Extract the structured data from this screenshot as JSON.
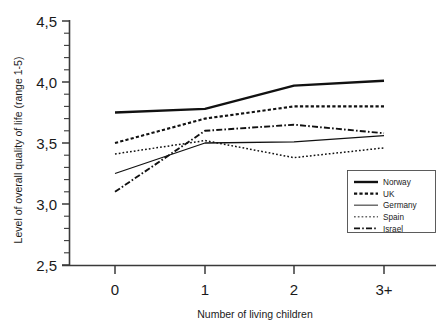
{
  "chart_data": {
    "type": "line",
    "title": "",
    "xlabel": "Number of living children",
    "ylabel": "Level of overall quality of life (range 1-5)",
    "categories": [
      "0",
      "1",
      "2",
      "3+"
    ],
    "x": [
      0,
      1,
      2,
      3
    ],
    "ylim": [
      2.5,
      4.5
    ],
    "ytick_labels": [
      "2,5",
      "3,0",
      "3,5",
      "4,0",
      "4,5"
    ],
    "ytick_values": [
      2.5,
      3.0,
      3.5,
      4.0,
      4.5
    ],
    "yminor_step": 0.1,
    "grid": false,
    "legend_position": "lower-right",
    "series": [
      {
        "name": "Norway",
        "values": [
          3.75,
          3.78,
          3.97,
          4.01
        ],
        "style": "solid-thick",
        "color": "#111111"
      },
      {
        "name": "UK",
        "values": [
          3.5,
          3.7,
          3.8,
          3.8
        ],
        "style": "dotted-bold",
        "color": "#111111"
      },
      {
        "name": "Germany",
        "values": [
          3.25,
          3.5,
          3.51,
          3.56
        ],
        "style": "solid-thin",
        "color": "#555555"
      },
      {
        "name": "Spain",
        "values": [
          3.41,
          3.52,
          3.38,
          3.46
        ],
        "style": "dotted-fine",
        "color": "#666666"
      },
      {
        "name": "Israel",
        "values": [
          3.1,
          3.6,
          3.65,
          3.58
        ],
        "style": "dash-dot",
        "color": "#111111"
      }
    ]
  },
  "axes": {
    "x_tick_labels": [
      "0",
      "1",
      "2",
      "3+"
    ],
    "y_tick_labels": [
      "4,5",
      "4,0",
      "3,5",
      "3,0",
      "2,5"
    ],
    "x_axis_title": "Number of living children",
    "y_axis_title": "Level of overall quality of life (range 1-5)"
  },
  "legend": {
    "entries": [
      {
        "label": "Norway"
      },
      {
        "label": "UK"
      },
      {
        "label": "Germany"
      },
      {
        "label": "Spain"
      },
      {
        "label": "Israel"
      }
    ]
  }
}
